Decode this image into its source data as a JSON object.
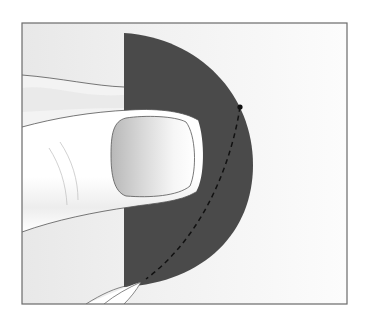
{
  "figure": {
    "type": "illustration",
    "caption": "",
    "colors": {
      "page_background": "#ffffff",
      "frame_stroke": "#6a6a6a",
      "frame_fill_left": "#e9e9e9",
      "frame_fill_right": "#fbfbfb",
      "disc_fill": "#4a4a4a",
      "dashed_line": "#111111",
      "marker_dot": "#111111",
      "skin_light": "#ffffff",
      "skin_shadow": "#ececec",
      "nail_dark": "#bdbdbd",
      "nail_light": "#ffffff",
      "outline": "#555555",
      "crease": "#b5b5b5"
    },
    "elements": {
      "frame": {
        "x": 22,
        "y": 23,
        "width": 325,
        "height": 281
      },
      "disc": {
        "flat_edge_x": 124,
        "top_y": 33,
        "bottom_y": 287,
        "right_x": 253
      },
      "marker_dot": {
        "cx": 240,
        "cy": 107,
        "r": 2.6
      },
      "dashed_line": {
        "start": [
          240,
          107
        ],
        "end": [
          146,
          279
        ]
      },
      "thumbnail": {
        "x": 110,
        "y": 115,
        "width": 85,
        "height": 85
      }
    }
  }
}
